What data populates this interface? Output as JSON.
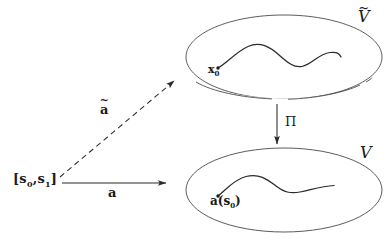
{
  "figure": {
    "kind": "commutative-diagram",
    "background_color": "#ffffff",
    "stroke_color": "#3a3a3a",
    "text_color": "#1a1a1a"
  },
  "labels": {
    "interval_base": "[s",
    "interval_sub0": "0",
    "interval_mid": ",s",
    "interval_sub1": "1",
    "interval_close": "]",
    "map_a": "a",
    "lift_a_base": "a",
    "lift_a_tilde": "~",
    "projection": "Π",
    "total_space_base": "V",
    "total_space_tilde": "~",
    "base_space": "V",
    "basepoint_lift": "x",
    "basepoint_lift_sub": "0",
    "basepoint_base": "a(s",
    "basepoint_base_sub": "0",
    "basepoint_base_close": ")"
  },
  "shapes": {
    "upper_ellipse": {
      "name": "covering-space-ellipse",
      "cx": 284,
      "cy": 57,
      "rx": 98,
      "ry": 42
    },
    "lower_ellipse": {
      "name": "base-space-ellipse",
      "cx": 284,
      "cy": 190,
      "rx": 98,
      "ry": 42
    },
    "upper_curve": {
      "name": "lifted-path-curve",
      "type": "double-wave",
      "start": [
        218,
        68
      ],
      "end": [
        332,
        60
      ]
    },
    "lower_curve": {
      "name": "path-curve",
      "type": "single-wave",
      "start": [
        218,
        196
      ],
      "end": [
        330,
        190
      ]
    },
    "horizontal_arrow": {
      "name": "map-a-arrow",
      "from": [
        62,
        183
      ],
      "to": [
        166,
        183
      ],
      "style": "solid"
    },
    "diagonal_arrow": {
      "name": "lift-a-arrow",
      "from": [
        60,
        178
      ],
      "to": [
        176,
        80
      ],
      "style": "dashed"
    },
    "vertical_arrow": {
      "name": "projection-arrow",
      "from": [
        277,
        104
      ],
      "to": [
        277,
        144
      ],
      "style": "solid"
    }
  }
}
